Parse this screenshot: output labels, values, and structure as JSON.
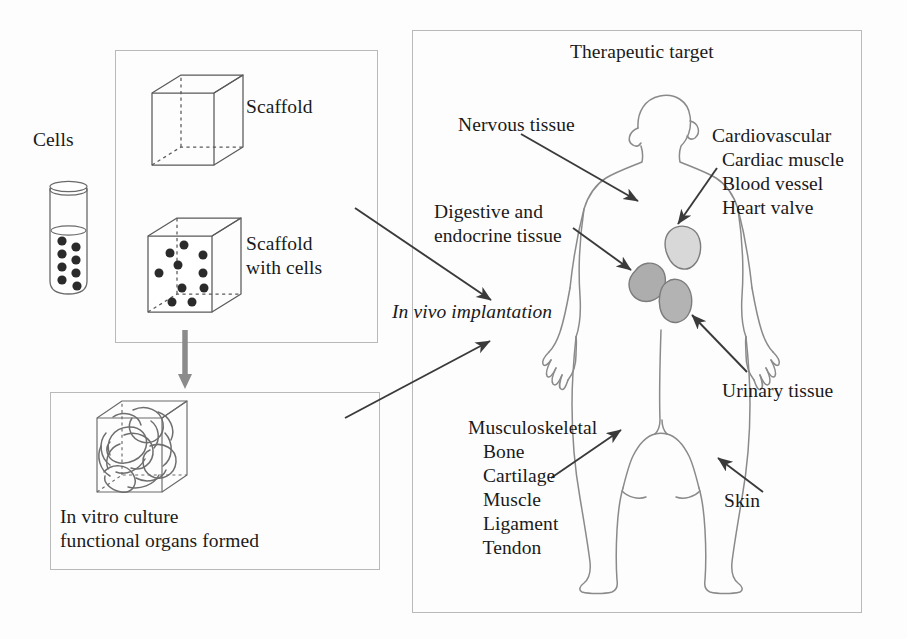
{
  "figure": {
    "colors": {
      "line": "#555555",
      "panel_border": "#b9b9b9",
      "body_outline": "#8a8a8a",
      "organ_light": "#d6d6d6",
      "organ_dark": "#a9a9a9",
      "arrow": "#3a3a3a",
      "text": "#1a1a1a",
      "background": "#fdfdfd"
    }
  },
  "left_column": {
    "cells_label": "Cells",
    "scaffold_panel": {
      "scaffold_label": "Scaffold",
      "scaffold_with_cells_label": "Scaffold\nwith cells"
    },
    "invitro_panel": {
      "caption": "In vitro culture\nfunctional organs formed"
    }
  },
  "transition": {
    "implantation_label": "In vivo implantation"
  },
  "target_panel": {
    "title": "Therapeutic target",
    "labels": {
      "nervous": "Nervous tissue",
      "cardiovascular": "Cardiovascular\n  Cardiac muscle\n  Blood vessel\n  Heart valve",
      "digestive": "Digestive and\nendocrine tissue",
      "urinary": "Urinary tissue",
      "musculoskeletal": "Musculoskeletal\n   Bone\n   Cartilage\n   Muscle\n   Ligament\n   Tendon",
      "skin": "Skin"
    }
  },
  "icons": {
    "test_tube": "test-tube-icon",
    "scaffold_cube": "cube-icon",
    "scaffold_cube_cells": "cube-with-cells-icon",
    "organ_cube": "cube-with-organs-icon",
    "human_body": "human-body-icon",
    "down_arrow": "down-arrow-icon"
  }
}
